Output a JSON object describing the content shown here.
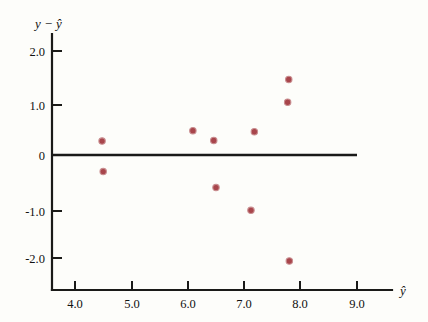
{
  "chart_data": {
    "type": "scatter",
    "title": "",
    "xlabel": "ŷ",
    "ylabel": "y − ŷ",
    "xlim": [
      3.55,
      9.6
    ],
    "ylim": [
      -2.35,
      2.25
    ],
    "grid": false,
    "legend": false,
    "reference_line": {
      "type": "horizontal",
      "y": 0,
      "x_start": 3.55,
      "x_end": 9.0
    },
    "xticks": [
      4.0,
      5.0,
      6.0,
      7.0,
      8.0,
      9.0
    ],
    "xtick_labels": [
      "4.0",
      "5.0",
      "6.0",
      "7.0",
      "8.0",
      "9.0"
    ],
    "yticks": [
      2.0,
      1.0,
      0,
      -1.0,
      -2.0
    ],
    "ytick_labels": [
      "2.0",
      "1.0",
      "0",
      "-1.0",
      "-2.0"
    ],
    "point_color": "#a8454b",
    "axis_color": "#1a1a18",
    "background_color": "#fdfdfa",
    "points": [
      {
        "x": 4.48,
        "y": 0.27
      },
      {
        "x": 4.5,
        "y": -0.32
      },
      {
        "x": 6.09,
        "y": 0.47
      },
      {
        "x": 6.46,
        "y": 0.28
      },
      {
        "x": 6.5,
        "y": -0.63
      },
      {
        "x": 7.18,
        "y": 0.45
      },
      {
        "x": 7.12,
        "y": -1.07
      },
      {
        "x": 7.79,
        "y": 1.46
      },
      {
        "x": 7.77,
        "y": 1.02
      },
      {
        "x": 7.8,
        "y": -2.05
      }
    ]
  },
  "labels": {
    "y_axis_title_var": "y",
    "y_axis_title_minus": "−",
    "y_axis_title_hat_var": "ŷ",
    "x_axis_title": "ŷ"
  },
  "accessibility": {
    "description": "Residual plot of y minus y-hat versus y-hat with ten plotted residual points and a horizontal zero reference line."
  }
}
